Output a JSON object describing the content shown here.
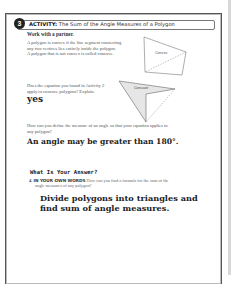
{
  "activity": {
    "number": "3",
    "label": "ACTIVITY:",
    "title": "The Sum of the Angle Measures of a Polygon",
    "subheading": "Work with a partner.",
    "definition_lines": [
      "A polygon is convex if the line segment connecting",
      "any two vertices lies entirely inside the polygon.",
      "A polygon that is not convex is called concave."
    ],
    "figures": {
      "convex_label": "Convex",
      "concave_label": "Concave"
    },
    "question_1_lines": [
      "Does the equation you found in Activity 2",
      "apply to concave polygons? Explain."
    ],
    "answer_1": "yes",
    "question_2_lines": [
      "How can you define the measure of an angle so that your equation applies to",
      "any polygon?"
    ],
    "answer_2": "An angle may be greater than 180°."
  },
  "answer_section": {
    "title": "What Is Your Answer?",
    "q_number": "4.",
    "q_tag": "IN YOUR OWN WORDS",
    "q_text_line1": "How can you find a formula for the sum of the",
    "q_text_line2": "angle measures of any polygon?",
    "answer_lines": [
      "Divide polygons into triangles and",
      "find sum of angle measures."
    ]
  },
  "colors": {
    "frame": "#555555",
    "badge": "#222222",
    "concave_fill": "#e6e6e6"
  }
}
